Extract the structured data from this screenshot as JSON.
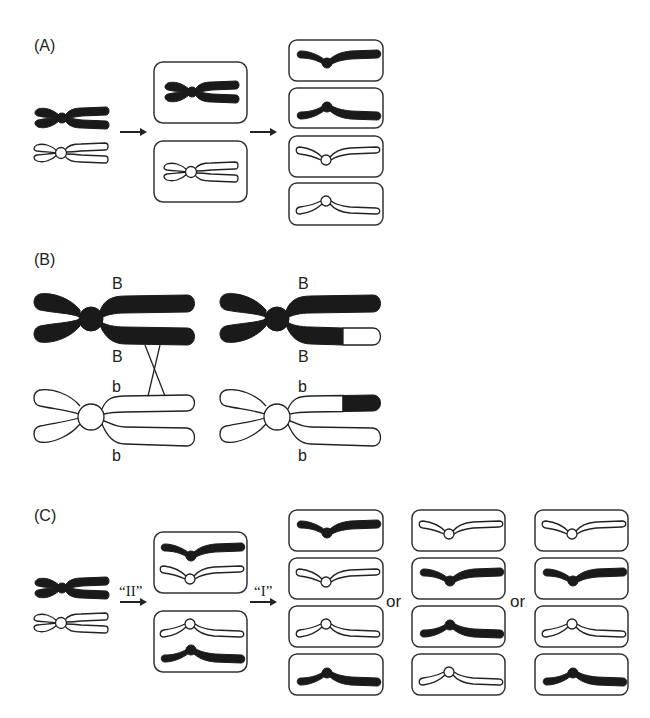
{
  "figure": {
    "panels": [
      {
        "id": "A",
        "label": "(A)",
        "description": "Normal meiosis: homologs segregate at division I, sister chromatids at division II",
        "arrows": [
          "",
          ""
        ],
        "stage1": {
          "type": "bivalent",
          "chromosomes": [
            "dark",
            "light"
          ]
        },
        "stage2": [
          [
            "dark-dyad"
          ],
          [
            "light-dyad"
          ]
        ],
        "stage3": [
          [
            "dark-V-down"
          ],
          [
            "dark-V-up"
          ],
          [
            "light-V-down"
          ],
          [
            "light-V-up"
          ]
        ]
      },
      {
        "id": "B",
        "label": "(B)",
        "description": "Crossover between homologous chromatids",
        "allele_labels": {
          "left": {
            "top": "B",
            "mid_upper": "B",
            "mid_lower": "b",
            "bottom": "b"
          },
          "right": {
            "top": "B",
            "mid_upper": "B",
            "mid_lower": "b",
            "bottom": "b"
          }
        }
      },
      {
        "id": "C",
        "label": "(C)",
        "description": "Inverted meiosis: sister chromatids separate first, then homologs",
        "stage_labels": {
          "first": "“II”",
          "second": "“I”"
        },
        "or_labels": [
          "or",
          "or"
        ],
        "stage2": [
          [
            "dark-V-down",
            "light-V-down"
          ],
          [
            "light-V-up",
            "dark-V-up"
          ]
        ],
        "outcomes": [
          [
            "dark-V-down",
            "light-V-down",
            "light-V-up",
            "dark-V-up"
          ],
          [
            "light-V-down",
            "dark-V-down",
            "dark-V-up",
            "light-V-up"
          ],
          [
            "light-V-down",
            "dark-V-down",
            "light-V-up",
            "dark-V-up"
          ]
        ]
      }
    ],
    "colors": {
      "dark": "#1a1a1a",
      "light": "#ffffff",
      "outline": "#333333"
    }
  }
}
